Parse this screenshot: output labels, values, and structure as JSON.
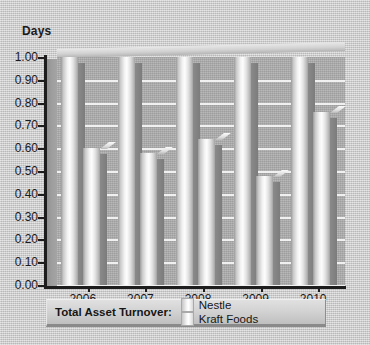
{
  "chart_data": {
    "type": "bar",
    "title": "",
    "ylabel": "Days",
    "xlabel": "",
    "categories": [
      "2006",
      "2007",
      "2008",
      "2009",
      "2010"
    ],
    "series": [
      {
        "name": "Nestle",
        "values": [
          1.0,
          1.0,
          1.0,
          1.0,
          1.0
        ]
      },
      {
        "name": "Kraft Foods",
        "values": [
          0.6,
          0.58,
          0.64,
          0.48,
          0.76
        ]
      }
    ],
    "ylim": [
      0.0,
      1.0
    ],
    "ytick_labels": [
      "1.00",
      "0.90",
      "0.80",
      "0.70",
      "0.60",
      "0.50",
      "0.40",
      "0.30",
      "0.20",
      "0.10",
      "0.00"
    ],
    "ytick_values": [
      1.0,
      0.9,
      0.8,
      0.7,
      0.6,
      0.5,
      0.4,
      0.3,
      0.2,
      0.1,
      0.0
    ],
    "grid": true,
    "legend_position": "bottom",
    "style": "3d-grouped-bar",
    "note": "Nestle bars are clipped at the top of the 1.00 axis"
  },
  "legend": {
    "title": "Total Asset Turnover:",
    "entries": [
      {
        "label": "Nestle"
      },
      {
        "label": "Kraft Foods"
      }
    ]
  },
  "colors": {
    "canvas_background": "#cbcbcb",
    "plot_background": "#a8a8a8",
    "gridline": "#f3f3f3",
    "axis": "#1d1d1d",
    "bar_highlight": "#fdfdfd",
    "bar_shadow": "#7c7c7c",
    "text": "#1b1b1b"
  }
}
